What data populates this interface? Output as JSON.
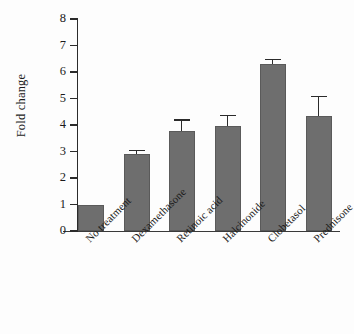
{
  "chart_data": {
    "type": "bar",
    "title": "",
    "xlabel": "",
    "ylabel": "Fold change",
    "ylim": [
      0,
      8
    ],
    "yticks": [
      0,
      1,
      2,
      3,
      4,
      5,
      6,
      7,
      8
    ],
    "grid": false,
    "legend": null,
    "categories": [
      "No treatment",
      "Dexamethasone",
      "Retinoic acid",
      "Halcinonide",
      "Clobetasol",
      "Prednisone"
    ],
    "values": [
      1.0,
      2.9,
      3.77,
      3.97,
      6.3,
      4.35
    ],
    "errors": [
      0,
      0.12,
      0.4,
      0.36,
      0.15,
      0.7
    ],
    "bar_color": "#6e6e6e",
    "bar_edge_color": "#5a5a5a",
    "error_color": "#2b2b2b",
    "axis_color": "#2b2b2b",
    "background": "#fdfdfd"
  }
}
